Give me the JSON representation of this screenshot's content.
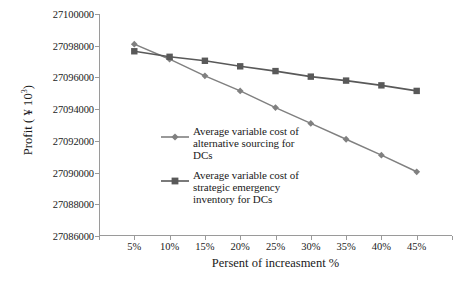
{
  "chart_data": {
    "type": "line",
    "title": "",
    "xlabel": "Persent of increasment %",
    "ylabel": "Profit (¥ 10³)",
    "ylabel_prefix": "Profit ( ¥ 10",
    "ylabel_sup": "3",
    "ylabel_suffix": ")",
    "categories": [
      "5%",
      "10%",
      "15%",
      "20%",
      "25%",
      "30%",
      "35%",
      "40%",
      "45%"
    ],
    "x": [
      5,
      10,
      15,
      20,
      25,
      30,
      35,
      40,
      45
    ],
    "ylim": [
      27086000,
      27100000
    ],
    "yticks": [
      27086000,
      27088000,
      27090000,
      27092000,
      27094000,
      27096000,
      27098000,
      27100000
    ],
    "ytick_labels": [
      "27086000",
      "27088000",
      "27090000",
      "27092000",
      "27094000",
      "27096000",
      "27098000",
      "27100000"
    ],
    "grid": false,
    "legend_position": "center-left-inside",
    "series": [
      {
        "name": "Average variable cost of alternative sourcing for DCs",
        "name_lines": [
          "Average variable cost of",
          "alternative sourcing for",
          "DCs"
        ],
        "marker": "diamond",
        "color": "#808080",
        "values": [
          27098100,
          27097150,
          27096100,
          27095150,
          27094100,
          27093100,
          27092100,
          27091100,
          27090050
        ]
      },
      {
        "name": "Average variable cost of strategic emergency inventory for DCs",
        "name_lines": [
          "Average variable cost of",
          "strategic emergency",
          "inventory for DCs"
        ],
        "marker": "square",
        "color": "#595959",
        "values": [
          27097650,
          27097300,
          27097050,
          27096700,
          27096400,
          27096050,
          27095800,
          27095500,
          27095150
        ]
      }
    ]
  },
  "colors": {
    "axis": "#9a9a9a",
    "series_1": "#808080",
    "series_2": "#595959",
    "background": "#ffffff",
    "text": "#1a1a1a"
  }
}
